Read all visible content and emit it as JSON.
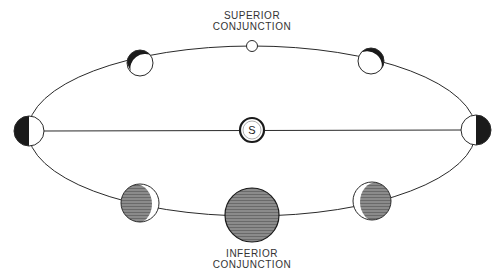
{
  "diagram": {
    "labels": {
      "superior_line1": "SUPERIOR",
      "superior_line2": "CONJUNCTION",
      "inferior_line1": "INFERIOR",
      "inferior_line2": "CONJUNCTION",
      "sun": "S"
    },
    "colors": {
      "stroke": "#2a2a2a",
      "dark": "#1a1a1a",
      "hatch": "#555555",
      "light": "#ffffff"
    },
    "phases": [
      {
        "name": "superior-conjunction",
        "phase": "full",
        "x": 252,
        "y": 46,
        "r": 5
      },
      {
        "name": "upper-left",
        "phase": "gibbous",
        "x": 140,
        "y": 63,
        "r": 13
      },
      {
        "name": "upper-right",
        "phase": "gibbous",
        "x": 371,
        "y": 61,
        "r": 13
      },
      {
        "name": "greatest-elongation-left",
        "phase": "half",
        "x": 29,
        "y": 131,
        "r": 15
      },
      {
        "name": "greatest-elongation-right",
        "phase": "half",
        "x": 476,
        "y": 130,
        "r": 15
      },
      {
        "name": "lower-left",
        "phase": "crescent",
        "x": 140,
        "y": 203,
        "r": 19
      },
      {
        "name": "inferior-conjunction",
        "phase": "new",
        "x": 252,
        "y": 215,
        "r": 27
      },
      {
        "name": "lower-right",
        "phase": "crescent",
        "x": 372,
        "y": 201,
        "r": 19
      }
    ]
  }
}
